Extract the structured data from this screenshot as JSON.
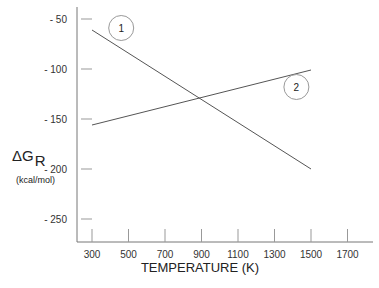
{
  "chart_data": {
    "type": "line",
    "title": "",
    "xlabel": "TEMPERATURE (K)",
    "ylabel": "ΔG_R",
    "ylabel_symbol": "ΔG",
    "ylabel_subscript": "R",
    "ylabel_units": "(kcal/mol)",
    "xlim": [
      250,
      1850
    ],
    "ylim": [
      -273,
      -38
    ],
    "x_ticks": [
      300,
      500,
      700,
      900,
      1100,
      1300,
      1500,
      1700
    ],
    "x_tick_labels": [
      "300",
      "500",
      "700",
      "900",
      "1100",
      "1300",
      "1500",
      "1700"
    ],
    "y_ticks": [
      -50,
      -100,
      -150,
      -200,
      -250
    ],
    "y_tick_labels": [
      "- 50",
      "- 100",
      "- 150",
      "- 200",
      "- 250"
    ],
    "grid": false,
    "legend": "none (curves labeled with circled numbers)",
    "series": [
      {
        "name": "1",
        "x": [
          300,
          1500
        ],
        "y": [
          -61,
          -200
        ],
        "color": "#555555"
      },
      {
        "name": "2",
        "x": [
          300,
          1500
        ],
        "y": [
          -156,
          -101
        ],
        "color": "#555555"
      }
    ],
    "annotations": [
      {
        "text": "1",
        "shape": "circle",
        "x": 460,
        "y": -59
      },
      {
        "text": "2",
        "shape": "circle",
        "x": 1420,
        "y": -118
      }
    ],
    "intersection": {
      "x": 900,
      "y": -129
    }
  }
}
